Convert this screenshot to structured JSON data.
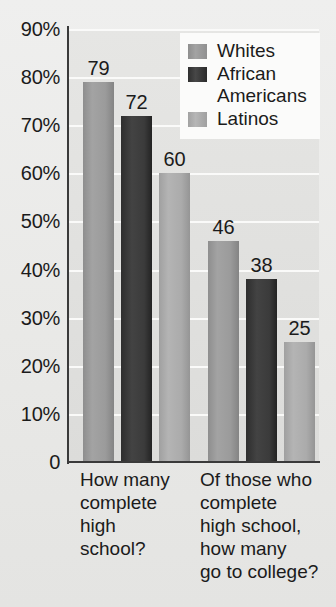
{
  "chart_data": {
    "type": "bar",
    "title": "",
    "subtitle": "",
    "xlabel": "",
    "ylabel": "",
    "categories": [
      "How many\ncomplete\nhigh\nschool?",
      "Of those who\ncomplete\nhigh school,\nhow many\ngo to college?"
    ],
    "series": [
      {
        "name": "Whites",
        "values": [
          79,
          60
        ]
      },
      {
        "name": "African\nAmericans",
        "values": [
          72,
          38
        ]
      },
      {
        "name": "Latinos",
        "values": [
          60,
          25
        ]
      }
    ],
    "plotted_bars": [
      {
        "group": 0,
        "series": "Whites",
        "value": 79,
        "label": "79",
        "color": "#9b9b9b"
      },
      {
        "group": 0,
        "series": "African Americans",
        "value": 72,
        "label": "72",
        "color": "#3b3b3b"
      },
      {
        "group": 0,
        "series": "Latinos",
        "value": 60,
        "label": "60",
        "color": "#ababab"
      },
      {
        "group": 1,
        "series": "Whites",
        "value": 46,
        "label": "46",
        "color": "#9b9b9b"
      },
      {
        "group": 1,
        "series": "African Americans",
        "value": 38,
        "label": "38",
        "color": "#3b3b3b"
      },
      {
        "group": 1,
        "series": "Latinos",
        "value": 25,
        "label": "25",
        "color": "#ababab"
      }
    ],
    "ylim": [
      0,
      90
    ],
    "y_ticks": [
      0,
      10,
      20,
      30,
      40,
      50,
      60,
      70,
      80,
      90
    ],
    "y_tick_labels": [
      "0",
      "10%",
      "20%",
      "30%",
      "40%",
      "50%",
      "60%",
      "70%",
      "80%",
      "90%"
    ],
    "grid": true,
    "grid_axis": "y",
    "legend_position": "top-right",
    "legend_entries": [
      "Whites",
      "African\nAmericans",
      "Latinos"
    ],
    "value_labels_shown": true
  },
  "colors": {
    "page_background": "#ececeb",
    "plot_background": "#e2e2e0",
    "gridline": "#fbfbfa",
    "axis_line": "#3a3a3a",
    "text": "#1b1b1b",
    "legend_background": "#fbfbfa",
    "series_whites": "#9b9b9b",
    "series_african_americans": "#3b3b3b",
    "series_latinos": "#ababab"
  }
}
